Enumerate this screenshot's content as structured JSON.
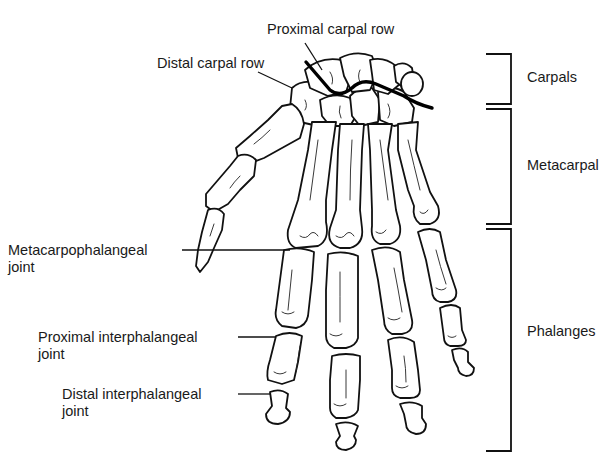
{
  "figure": {
    "colors": {
      "line": "#111111",
      "background": "#ffffff"
    }
  },
  "labels": {
    "proximal_carpal_row": "Proximal carpal row",
    "distal_carpal_row": "Distal carpal row",
    "metacarpophalangeal": {
      "line1": "Metacarpophalangeal",
      "line2": "joint"
    },
    "proximal_interphalangeal": {
      "line1": "Proximal interphalangeal",
      "line2": "joint"
    },
    "distal_interphalangeal": {
      "line1": "Distal interphalangeal",
      "line2": "joint"
    }
  },
  "brackets": [
    {
      "id": "carpals",
      "label": "Carpals"
    },
    {
      "id": "metacarpal",
      "label": "Metacarpal"
    },
    {
      "id": "phalanges",
      "label": "Phalanges"
    }
  ]
}
